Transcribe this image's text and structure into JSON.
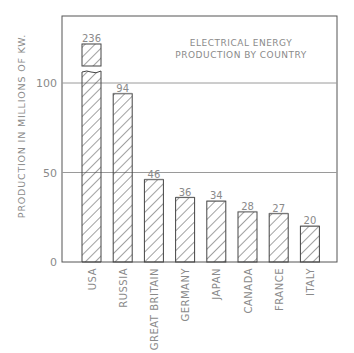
{
  "chart_data": {
    "type": "bar",
    "title": "ELECTRICAL ENERGY PRODUCTION BY COUNTRY",
    "title_lines": [
      "ELECTRICAL ENERGY",
      "PRODUCTION BY COUNTRY"
    ],
    "xlabel": "",
    "ylabel": "PRODUCTION IN MILLIONS OF KW.",
    "categories": [
      "USA",
      "RUSSIA",
      "GREAT BRITAIN",
      "GERMANY",
      "JAPAN",
      "CANADA",
      "FRANCE",
      "ITALY"
    ],
    "values": [
      236,
      94,
      46,
      36,
      34,
      28,
      27,
      20
    ],
    "value_labels": [
      "236",
      "94",
      "46",
      "36",
      "34",
      "28",
      "27",
      "20"
    ],
    "ylim": [
      0,
      120
    ],
    "yticks": [
      0,
      50,
      100
    ],
    "ytick_labels": [
      "0",
      "50",
      "100"
    ],
    "grid": true,
    "bar_fill": "diagonal-hatch",
    "broken_axis_bar": "USA",
    "legend": null
  },
  "colors": {
    "axis": "#555555",
    "grid": "#9a9a9a",
    "bar_outline": "#444444",
    "hatch": "#444444",
    "text": "#8a8a8a"
  }
}
